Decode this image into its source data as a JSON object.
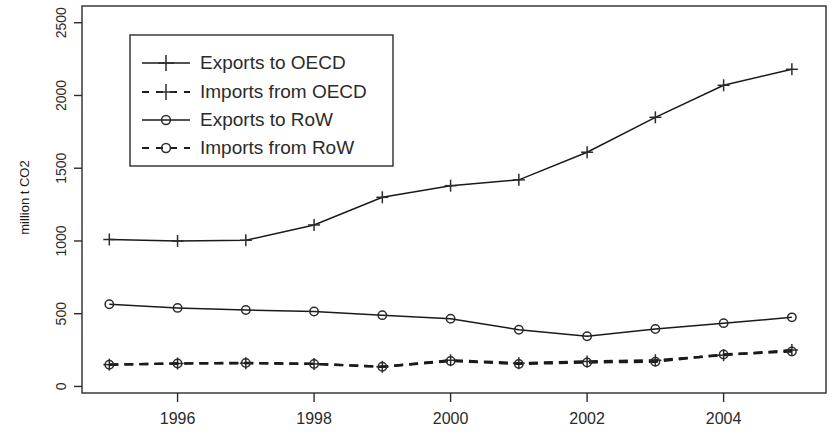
{
  "chart_data": {
    "type": "line",
    "title": "",
    "xlabel": "",
    "ylabel": "million t CO2",
    "x": [
      1995,
      1996,
      1997,
      1998,
      1999,
      2000,
      2001,
      2002,
      2003,
      2004,
      2005
    ],
    "xticks": [
      1996,
      1998,
      2000,
      2002,
      2004
    ],
    "xtick_labels": [
      "1996",
      "1998",
      "2000",
      "2002",
      "2004"
    ],
    "yticks": [
      0,
      500,
      1000,
      1500,
      2000,
      2500
    ],
    "ytick_labels": [
      "0",
      "500",
      "1000",
      "1500",
      "2000",
      "2500"
    ],
    "xlim": [
      1994.6,
      2005.5
    ],
    "ylim": [
      -45,
      2615
    ],
    "grid": false,
    "legend_position": "top-left",
    "series": [
      {
        "name": "Exports to OECD",
        "marker": "plus",
        "linestyle": "solid",
        "color": "#1a1a1a",
        "values": [
          1010,
          1000,
          1005,
          1110,
          1300,
          1380,
          1420,
          1610,
          1850,
          2070,
          2180
        ]
      },
      {
        "name": "Imports from OECD",
        "marker": "plus",
        "linestyle": "dashed",
        "color": "#1a1a1a",
        "values": [
          150,
          158,
          160,
          155,
          135,
          180,
          160,
          172,
          180,
          215,
          250
        ]
      },
      {
        "name": "Exports to RoW",
        "marker": "circle",
        "linestyle": "solid",
        "color": "#1a1a1a",
        "values": [
          565,
          540,
          525,
          515,
          490,
          465,
          390,
          345,
          395,
          435,
          475
        ]
      },
      {
        "name": "Imports from RoW",
        "marker": "circle",
        "linestyle": "dashed",
        "color": "#1a1a1a",
        "values": [
          150,
          158,
          162,
          155,
          135,
          175,
          155,
          165,
          170,
          220,
          240
        ]
      }
    ]
  },
  "legend": {
    "entries": [
      {
        "label": "Exports to OECD"
      },
      {
        "label": "Imports from OECD"
      },
      {
        "label": "Exports to RoW"
      },
      {
        "label": "Imports from RoW"
      }
    ]
  }
}
